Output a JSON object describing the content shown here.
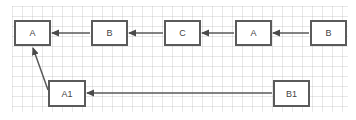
{
  "diagram": {
    "nodes": [
      {
        "id": "n1",
        "label": "A"
      },
      {
        "id": "n2",
        "label": "B"
      },
      {
        "id": "n3",
        "label": "C"
      },
      {
        "id": "n4",
        "label": "A"
      },
      {
        "id": "n5",
        "label": "B"
      },
      {
        "id": "n6",
        "label": "A1"
      },
      {
        "id": "n7",
        "label": "B1"
      }
    ],
    "edges": [
      {
        "from": "n2",
        "to": "n1"
      },
      {
        "from": "n3",
        "to": "n2"
      },
      {
        "from": "n4",
        "to": "n3"
      },
      {
        "from": "n5",
        "to": "n4"
      },
      {
        "from": "n7",
        "to": "n6"
      },
      {
        "from": "n6",
        "to": "n1"
      }
    ],
    "colors": {
      "stroke": "#5a5a5a",
      "grid": "#e6e6e6",
      "text": "#444444"
    }
  }
}
